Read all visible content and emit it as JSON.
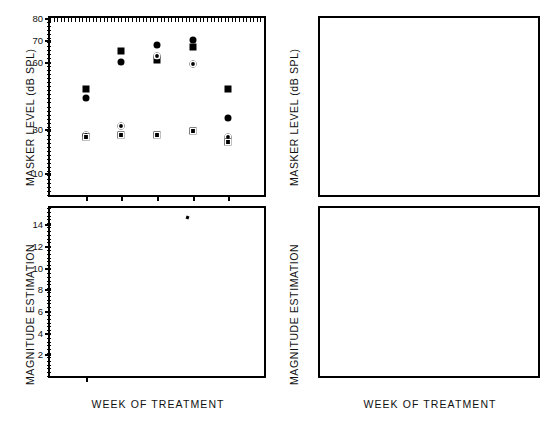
{
  "figure": {
    "panels": [
      {
        "id": "top-left",
        "ylabel": "MASKER  LEVEL  (dB SPL)",
        "xlabel": "WEEK OF TREATMENT",
        "ytick_labels": [
          "80",
          "70",
          "60",
          "30",
          "10"
        ],
        "xtick_labels": [
          "1",
          "2",
          "3",
          "4",
          "5"
        ]
      },
      {
        "id": "bottom-left",
        "ylabel": "MAGNITUDE  ESTIMATION",
        "xlabel": "WEEK OF TREATMENT",
        "ytick_labels": [
          "14",
          "12",
          "10",
          "8",
          "6",
          "4",
          "2"
        ],
        "xtick_labels": [
          "1",
          "2",
          "3",
          "4",
          "5"
        ]
      },
      {
        "id": "top-right",
        "ylabel": "MASKER  LEVEL  (dB SPL)",
        "xlabel": "WEEK OF TREATMENT",
        "ytick_labels": [
          "80",
          "70",
          "60",
          "30",
          "10"
        ],
        "xtick_labels": [
          "1",
          "2",
          "3",
          "4",
          "5",
          "6",
          "7",
          "8",
          "9"
        ]
      },
      {
        "id": "bottom-right",
        "ylabel": "MAGNITUDE  ESTIMATION",
        "xlabel": "WEEK OF TREATMENT",
        "ytick_labels": [
          "9",
          "8",
          "7",
          "6",
          "5",
          "4",
          "3",
          "2",
          "1"
        ],
        "xtick_labels": [
          "1",
          "2",
          "3",
          "4",
          "5",
          "6",
          "7",
          "8",
          "9"
        ]
      }
    ]
  },
  "chart_data": [
    {
      "type": "scatter",
      "id": "top-left",
      "title": "",
      "xlabel": "WEEK OF TREATMENT",
      "ylabel": "MASKER LEVEL (dB SPL)",
      "xlim": [
        0,
        6
      ],
      "ylim": [
        0,
        80
      ],
      "yticks": [
        10,
        30,
        60,
        70,
        80
      ],
      "ytick_labels": [
        "10",
        "30",
        "60",
        "70",
        "80"
      ],
      "xticks": [
        1,
        2,
        3,
        4,
        5
      ],
      "grid": false,
      "legend": "none",
      "series": [
        {
          "name": "filled-circle",
          "marker": "filled-circle",
          "points": [
            {
              "x": 1,
              "y": 44
            },
            {
              "x": 2,
              "y": 60
            },
            {
              "x": 3,
              "y": 68
            },
            {
              "x": 4,
              "y": 70
            },
            {
              "x": 5,
              "y": 35
            }
          ]
        },
        {
          "name": "filled-square",
          "marker": "filled-square",
          "points": [
            {
              "x": 1,
              "y": 48
            },
            {
              "x": 2,
              "y": 65
            },
            {
              "x": 3,
              "y": 61
            },
            {
              "x": 4,
              "y": 67
            },
            {
              "x": 5,
              "y": 48
            }
          ]
        },
        {
          "name": "open-circle",
          "marker": "open-circle",
          "points": [
            {
              "x": 1,
              "y": 27
            },
            {
              "x": 2,
              "y": 31
            },
            {
              "x": 3,
              "y": 63
            },
            {
              "x": 4,
              "y": 59
            },
            {
              "x": 5,
              "y": 26
            }
          ]
        },
        {
          "name": "open-square",
          "marker": "open-square",
          "points": [
            {
              "x": 1,
              "y": 26
            },
            {
              "x": 2,
              "y": 27
            },
            {
              "x": 3,
              "y": 27
            },
            {
              "x": 4,
              "y": 29
            },
            {
              "x": 5,
              "y": 24
            }
          ]
        }
      ]
    },
    {
      "type": "scatter",
      "id": "bottom-left",
      "title": "",
      "xlabel": "WEEK OF TREATMENT",
      "ylabel": "MAGNITUDE ESTIMATION",
      "xlim": [
        0,
        6
      ],
      "ylim": [
        0,
        15.5
      ],
      "yticks": [
        2,
        4,
        6,
        8,
        10,
        12,
        14
      ],
      "ytick_labels": [
        "2",
        "4",
        "6",
        "8",
        "10",
        "12",
        "14"
      ],
      "xticks": [
        1,
        2,
        3,
        4,
        5
      ],
      "grid": false,
      "legend": "none",
      "series": [
        {
          "name": "open-square",
          "marker": "open-square",
          "points": [
            {
              "x": 1,
              "y": 10
            },
            {
              "x": 2,
              "y": 12
            },
            {
              "x": 3,
              "y": 15
            },
            {
              "x": 4,
              "y": 12
            },
            {
              "x": 5,
              "y": 7
            }
          ]
        },
        {
          "name": "x-marker",
          "marker": "x",
          "points": [
            {
              "x": 2,
              "y": 8
            },
            {
              "x": 3,
              "y": 10
            },
            {
              "x": 4,
              "y": 8
            },
            {
              "x": 5,
              "y": 5
            }
          ]
        },
        {
          "name": "filled-circle",
          "marker": "filled-circle",
          "points": [
            {
              "x": 1,
              "y": 5
            },
            {
              "x": 2,
              "y": 7
            },
            {
              "x": 3,
              "y": 9
            },
            {
              "x": 4,
              "y": 7
            },
            {
              "x": 5,
              "y": 4
            }
          ]
        }
      ]
    },
    {
      "type": "scatter",
      "id": "top-right",
      "title": "",
      "xlabel": "WEEK OF TREATMENT",
      "ylabel": "MASKER LEVEL (dB SPL)",
      "xlim": [
        0,
        10
      ],
      "ylim": [
        0,
        80
      ],
      "yticks": [
        10,
        30,
        60,
        70,
        80
      ],
      "ytick_labels": [
        "10",
        "30",
        "60",
        "70",
        "80"
      ],
      "xticks": [
        1,
        2,
        3,
        4,
        5,
        6,
        7,
        8,
        9
      ],
      "grid": false,
      "legend": "none",
      "series": [
        {
          "name": "filled-circle",
          "marker": "filled-circle",
          "points": [
            {
              "x": 1,
              "y": 71
            },
            {
              "x": 2,
              "y": 64
            },
            {
              "x": 3,
              "y": 65
            },
            {
              "x": 4,
              "y": 58
            },
            {
              "x": 5,
              "y": 61
            },
            {
              "x": 7,
              "y": 64
            },
            {
              "x": 9,
              "y": 33
            }
          ]
        },
        {
          "name": "filled-square",
          "marker": "filled-square",
          "points": [
            {
              "x": 1,
              "y": 65
            },
            {
              "x": 2,
              "y": 63
            },
            {
              "x": 3,
              "y": 61
            },
            {
              "x": 4,
              "y": 57
            },
            {
              "x": 5,
              "y": 59
            },
            {
              "x": 7,
              "y": 63
            },
            {
              "x": 9,
              "y": 32
            }
          ]
        },
        {
          "name": "open-circle",
          "marker": "open-circle",
          "points": [
            {
              "x": 1,
              "y": 9
            },
            {
              "x": 2,
              "y": 19
            },
            {
              "x": 3,
              "y": 22
            },
            {
              "x": 4,
              "y": 17
            },
            {
              "x": 5,
              "y": 30
            },
            {
              "x": 7,
              "y": 25
            },
            {
              "x": 9,
              "y": 18
            }
          ]
        },
        {
          "name": "open-square",
          "marker": "open-square",
          "points": [
            {
              "x": 1,
              "y": 13
            },
            {
              "x": 2,
              "y": 15
            },
            {
              "x": 3,
              "y": 16
            },
            {
              "x": 4,
              "y": 11
            },
            {
              "x": 5,
              "y": 14
            },
            {
              "x": 7,
              "y": 20
            },
            {
              "x": 9,
              "y": 21
            }
          ]
        }
      ]
    },
    {
      "type": "scatter",
      "id": "bottom-right",
      "title": "",
      "xlabel": "WEEK OF TREATMENT",
      "ylabel": "MAGNITUDE ESTIMATION",
      "xlim": [
        0,
        10
      ],
      "ylim": [
        0,
        9.8
      ],
      "yticks": [
        1,
        2,
        3,
        4,
        5,
        6,
        7,
        8,
        9
      ],
      "ytick_labels": [
        "1",
        "2",
        "3",
        "4",
        "5",
        "6",
        "7",
        "8",
        "9"
      ],
      "xticks": [
        1,
        2,
        3,
        4,
        5,
        6,
        7,
        8,
        9
      ],
      "grid": false,
      "legend": "none",
      "series": [
        {
          "name": "open-circle",
          "marker": "open-circle",
          "points": [
            {
              "x": 1,
              "y": 8
            },
            {
              "x": 2,
              "y": 8
            },
            {
              "x": 3,
              "y": 7
            },
            {
              "x": 4,
              "y": 5
            }
          ]
        },
        {
          "name": "open-square",
          "marker": "open-square",
          "points": [
            {
              "x": 1,
              "y": 7
            },
            {
              "x": 2,
              "y": 7
            },
            {
              "x": 3,
              "y": 5
            },
            {
              "x": 5,
              "y": 1
            },
            {
              "x": 7,
              "y": 3
            }
          ]
        },
        {
          "name": "x-marker",
          "marker": "x",
          "points": [
            {
              "x": 1,
              "y": 6
            },
            {
              "x": 2,
              "y": 6
            },
            {
              "x": 3,
              "y": 6
            },
            {
              "x": 5,
              "y": 2
            }
          ]
        },
        {
          "name": "filled-circle",
          "marker": "filled-circle",
          "points": [
            {
              "x": 4,
              "y": 4
            },
            {
              "x": 7,
              "y": 4
            },
            {
              "x": 9,
              "y": 2
            }
          ]
        }
      ]
    }
  ]
}
